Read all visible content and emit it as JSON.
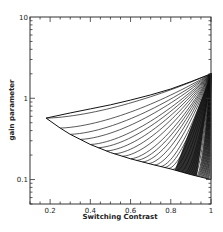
{
  "chart_data": {
    "type": "line",
    "title": "",
    "xlabel": "Switching Contrast",
    "ylabel": "gain parameter",
    "xlim": [
      0.1,
      1.0
    ],
    "ylim": [
      0.05,
      10
    ],
    "yscale": "log",
    "grid": false,
    "legend": null,
    "x_ticks": [
      0.2,
      0.4,
      0.6,
      0.8,
      1.0
    ],
    "x_tick_labels": [
      "0.2",
      "0.4",
      "0.6",
      "0.8",
      "1"
    ],
    "y_ticks": [
      0.1,
      1,
      10
    ],
    "y_tick_labels": [
      "0.1",
      "1",
      "10"
    ],
    "boundaries": {
      "lower_envelope": {
        "x": [
          0.18,
          0.25,
          0.3,
          0.4,
          0.5,
          0.6,
          0.7,
          0.8,
          0.9,
          1.0
        ],
        "y": [
          0.57,
          0.43,
          0.36,
          0.27,
          0.215,
          0.18,
          0.155,
          0.135,
          0.115,
          0.1
        ]
      },
      "upper_curve": {
        "x": [
          0.18,
          0.3,
          0.4,
          0.5,
          0.6,
          0.7,
          0.8,
          0.9,
          1.0
        ],
        "y": [
          0.57,
          0.66,
          0.74,
          0.83,
          0.95,
          1.1,
          1.3,
          1.6,
          2.0
        ]
      }
    },
    "family": {
      "description": "Family of curves starting on the lower envelope and converging at (1, 2); dense near x→1",
      "converge_point": [
        1.0,
        2.0
      ],
      "start_x": [
        0.18,
        0.25,
        0.3,
        0.35,
        0.4,
        0.44,
        0.48,
        0.52,
        0.56,
        0.6,
        0.63,
        0.66,
        0.69,
        0.72,
        0.75,
        0.77,
        0.79,
        0.81,
        0.83,
        0.85,
        0.87,
        0.88,
        0.89,
        0.9,
        0.91,
        0.92,
        0.93
      ],
      "dense_fill_end": [
        0.93,
        0.11
      ]
    }
  },
  "page": {
    "header_glyph": "-"
  }
}
